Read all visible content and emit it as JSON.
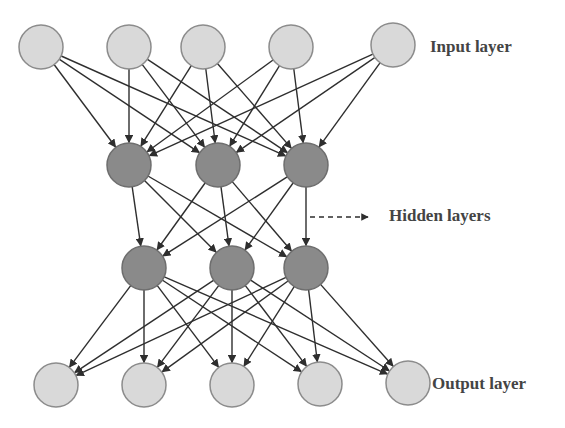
{
  "labels": {
    "input": "Input layer",
    "hidden": "Hidden layers",
    "output": "Output layer"
  },
  "colors": {
    "io_fill": "#d9d9d9",
    "io_stroke": "#8c8c8c",
    "hidden_fill": "#8a8a8a",
    "hidden_stroke": "#6e6e6e",
    "edge": "#2e2e2e"
  },
  "layers": [
    {
      "name": "input",
      "type": "io",
      "nodes": [
        [
          41,
          47
        ],
        [
          129,
          47
        ],
        [
          203,
          47
        ],
        [
          291,
          47
        ],
        [
          393,
          45
        ]
      ]
    },
    {
      "name": "hidden-1",
      "type": "hidden",
      "nodes": [
        [
          129,
          165
        ],
        [
          218,
          165
        ],
        [
          306,
          165
        ]
      ]
    },
    {
      "name": "hidden-2",
      "type": "hidden",
      "nodes": [
        [
          144,
          268
        ],
        [
          232,
          268
        ],
        [
          306,
          268
        ]
      ]
    },
    {
      "name": "output",
      "type": "io",
      "nodes": [
        [
          56,
          385
        ],
        [
          144,
          385
        ],
        [
          232,
          385
        ],
        [
          320,
          384
        ],
        [
          408,
          383
        ]
      ]
    }
  ],
  "node_radius": 22
}
